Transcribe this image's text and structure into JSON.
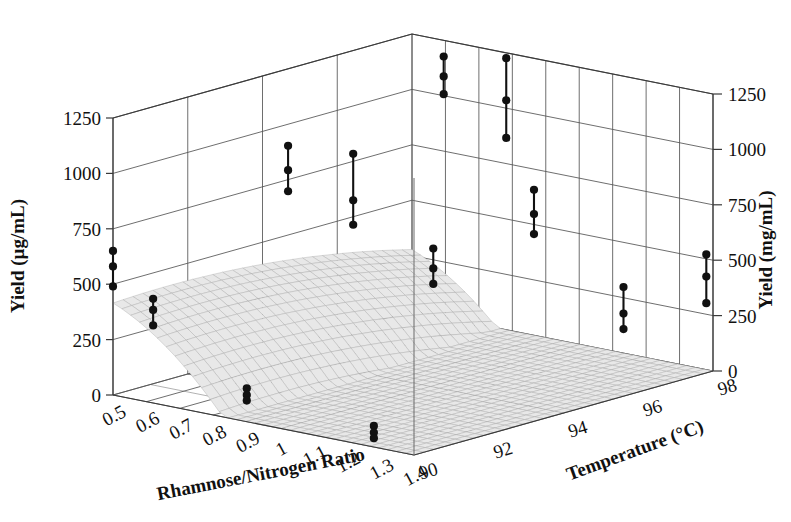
{
  "figure": {
    "kind": "3d-surface-response-plot",
    "background": "#ffffff",
    "line_color": "#555555",
    "surface_light": "#dcdcdc",
    "surface_mid": "#bfbfbf",
    "surface_dark": "#8e8e8e",
    "point_color": "#111111"
  },
  "axes": {
    "x": {
      "label": "Rhamnose/Nitrogen Ratio",
      "ticks": [
        "0.5",
        "0.6",
        "0.7",
        "0.8",
        "0.9",
        "1",
        "1.1",
        "1.2",
        "1.3",
        "1.4"
      ],
      "values": [
        0.5,
        0.6,
        0.7,
        0.8,
        0.9,
        1.0,
        1.1,
        1.2,
        1.3,
        1.4
      ],
      "range": [
        0.5,
        1.4
      ]
    },
    "y": {
      "label": "Temperature (°C)",
      "ticks": [
        "90",
        "92",
        "94",
        "96",
        "98"
      ],
      "values": [
        90,
        92,
        94,
        96,
        98
      ],
      "range": [
        90,
        98
      ]
    },
    "z_left": {
      "label": "Yield (µg/mL)",
      "ticks": [
        "0",
        "250",
        "500",
        "750",
        "1000",
        "1250"
      ],
      "values": [
        0,
        250,
        500,
        750,
        1000,
        1250
      ],
      "range": [
        0,
        1250
      ]
    },
    "z_right": {
      "label": "Yield (mg/mL)",
      "ticks": [
        "0",
        "250",
        "500",
        "750",
        "1000",
        "1250"
      ],
      "values": [
        0,
        250,
        500,
        750,
        1000,
        1250
      ],
      "range": [
        0,
        1250
      ]
    }
  },
  "chart_data": {
    "type": "surface",
    "title": "",
    "xlabel": "Rhamnose/Nitrogen Ratio",
    "ylabel": "Temperature (°C)",
    "zlabel": "Yield (µg/mL)",
    "xlim": [
      0.5,
      1.4
    ],
    "ylim": [
      90,
      98
    ],
    "zlim": [
      0,
      1250
    ],
    "grid": true,
    "legend": "none",
    "surface_model": {
      "description": "Quadratic response surface with ridge peak near x=0.95, y=93.5",
      "peak_x": 0.95,
      "peak_y": 93.4,
      "peak_z": 1480,
      "coeffs": {
        "b0": -28000,
        "bx": 900,
        "by": 620,
        "bxx": -1900,
        "byy": -3.4,
        "bxy": 4.0
      }
    },
    "grid_x": [
      0.5,
      0.6,
      0.7,
      0.8,
      0.9,
      1.0,
      1.1,
      1.2,
      1.3,
      1.4
    ],
    "grid_y": [
      90,
      92,
      94,
      96,
      98
    ],
    "observations": [
      {
        "x": 0.5,
        "y": 90.0,
        "mean": 580,
        "low": 490,
        "high": 650
      },
      {
        "x": 0.62,
        "y": 90.0,
        "mean": 420,
        "low": 350,
        "high": 470
      },
      {
        "x": 0.9,
        "y": 90.0,
        "mean": 120,
        "low": 95,
        "high": 150
      },
      {
        "x": 1.28,
        "y": 90.0,
        "mean": 65,
        "low": 40,
        "high": 95
      },
      {
        "x": 0.8,
        "y": 92.0,
        "mean": 1010,
        "low": 915,
        "high": 1120
      },
      {
        "x": 0.95,
        "y": 92.4,
        "mean": 900,
        "low": 790,
        "high": 1110
      },
      {
        "x": 1.1,
        "y": 93.2,
        "mean": 600,
        "low": 530,
        "high": 690
      },
      {
        "x": 0.93,
        "y": 95.0,
        "mean": 1330,
        "low": 1250,
        "high": 1420
      },
      {
        "x": 1.05,
        "y": 95.6,
        "mean": 1230,
        "low": 1060,
        "high": 1420
      },
      {
        "x": 1.2,
        "y": 95.0,
        "mean": 790,
        "low": 700,
        "high": 900
      },
      {
        "x": 1.3,
        "y": 96.5,
        "mean": 300,
        "low": 230,
        "high": 420
      },
      {
        "x": 1.38,
        "y": 98.0,
        "mean": 420,
        "low": 300,
        "high": 520
      }
    ]
  }
}
